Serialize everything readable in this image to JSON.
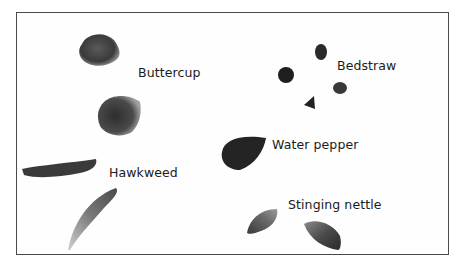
{
  "figure": {
    "labels": [
      {
        "id": "buttercup",
        "text": "Buttercup"
      },
      {
        "id": "bedstraw",
        "text": "Bedstraw"
      },
      {
        "id": "water_pepper",
        "text": "Water pepper"
      },
      {
        "id": "hawkweed",
        "text": "Hawkweed"
      },
      {
        "id": "stinging_nettle",
        "text": "Stinging nettle"
      }
    ],
    "colors": {
      "frame": "#4a4a4a",
      "seed_dark": "#2a2a2a",
      "text": "#1a1a1a"
    }
  }
}
